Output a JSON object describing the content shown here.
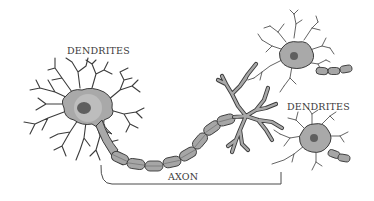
{
  "diagram": {
    "labels": {
      "dendrites_left": "DENDRITES",
      "dendrites_right": "DENDRITES",
      "axon": "AXON"
    },
    "components": [
      {
        "name": "neuron-main",
        "parts": [
          "soma",
          "nucleus",
          "dendrites",
          "myelinated-axon",
          "axon-terminals"
        ]
      },
      {
        "name": "neuron-upper-right",
        "parts": [
          "soma",
          "nucleus",
          "dendrites",
          "axon-stub"
        ]
      },
      {
        "name": "neuron-lower-right",
        "parts": [
          "soma",
          "nucleus",
          "dendrites",
          "axon-stub"
        ]
      }
    ],
    "colors": {
      "background": "#ffffff",
      "outline": "#3c3c3c",
      "soma_fill": "#a9a9a9",
      "nucleus_fill": "#5f5f5f",
      "myelin_fill": "#a6a6a6",
      "text": "#3a3a3a"
    }
  }
}
